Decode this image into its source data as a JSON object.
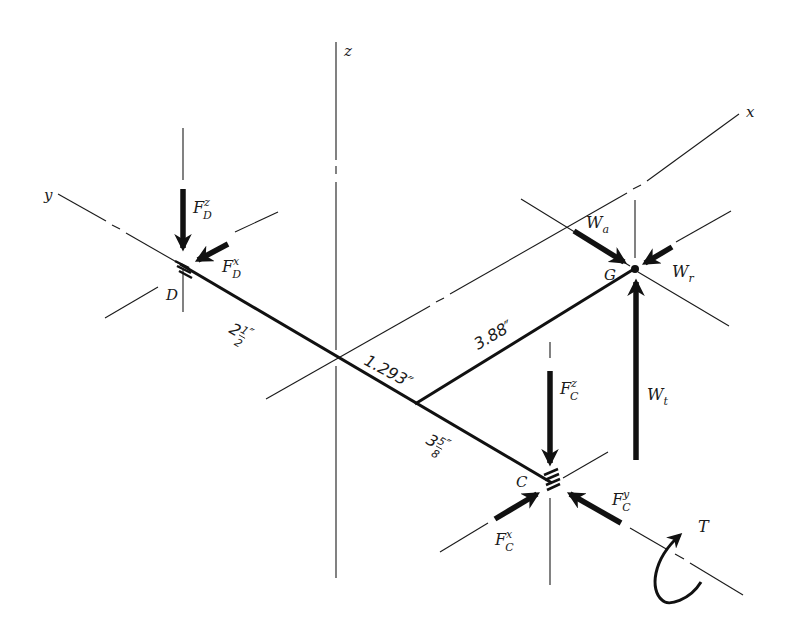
{
  "diagram": {
    "axes": {
      "x": "x",
      "y": "y",
      "z": "z"
    },
    "points": {
      "D": "D",
      "C": "C",
      "G": "G"
    },
    "forces": {
      "FDz": {
        "base": "F",
        "sup": "z",
        "sub": "D"
      },
      "FDx": {
        "base": "F",
        "sup": "x",
        "sub": "D"
      },
      "FCz": {
        "base": "F",
        "sup": "z",
        "sub": "C"
      },
      "FCx": {
        "base": "F",
        "sup": "x",
        "sub": "C"
      },
      "FCy": {
        "base": "F",
        "sup": "y",
        "sub": "C"
      },
      "Wa": {
        "base": "W",
        "sub": "a"
      },
      "Wr": {
        "base": "W",
        "sub": "r"
      },
      "Wt": {
        "base": "W",
        "sub": "t"
      },
      "T": {
        "base": "T"
      }
    },
    "dimensions": {
      "DtoO": {
        "whole": "2",
        "num": "1",
        "den": "2",
        "unit": "″"
      },
      "OtoJ": {
        "value": "1.293″"
      },
      "JtoG": {
        "value": "3.88″"
      },
      "JtoC": {
        "whole": "3",
        "num": "5",
        "den": "8",
        "unit": "″"
      }
    },
    "colors": {
      "ink": "#111111",
      "background": "#ffffff"
    }
  }
}
